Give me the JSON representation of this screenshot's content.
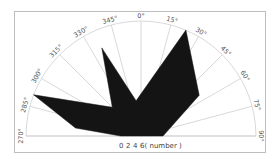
{
  "chart_data": {
    "type": "polar-area",
    "title": "",
    "angle_unit": "degrees",
    "angle_range": [
      270,
      90
    ],
    "angular_ticks": [
      "270°",
      "285°",
      "300°",
      "315°",
      "330°",
      "345°",
      "0°",
      "15°",
      "30°",
      "45°",
      "60°",
      "75°",
      "90°"
    ],
    "radial_ticks": [
      "0",
      "2",
      "4",
      "6"
    ],
    "radial_label": "( number )",
    "grid": true,
    "fill_color": "#141414",
    "points": [
      {
        "angle": 270,
        "r": 1.2
      },
      {
        "angle": 277,
        "r": 3.9
      },
      {
        "angle": 291,
        "r": 6.8
      },
      {
        "angle": 315,
        "r": 2.4
      },
      {
        "angle": 336,
        "r": 5.7
      },
      {
        "angle": 352,
        "r": 2.1
      },
      {
        "angle": 23,
        "r": 6.8
      },
      {
        "angle": 55,
        "r": 4.2
      },
      {
        "angle": 90,
        "r": 1.3
      }
    ],
    "rmax": 6.8
  },
  "geometry": {
    "cx": 141,
    "cy": 136,
    "R": 115,
    "label_R": 120
  }
}
